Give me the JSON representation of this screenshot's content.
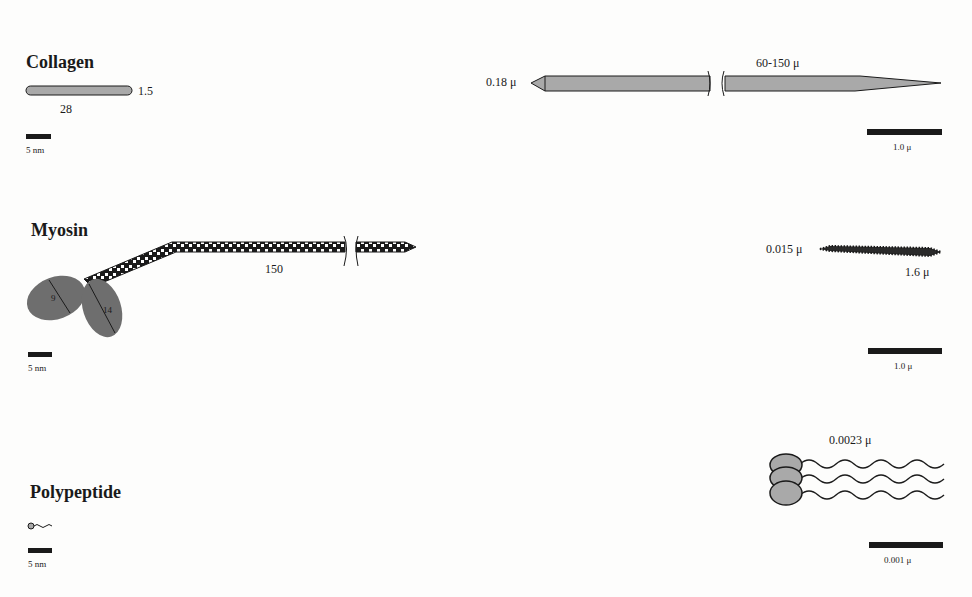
{
  "sections": {
    "collagen": {
      "title": "Collagen",
      "molecule": {
        "length_label": "28",
        "width_label": "1.5",
        "scale_label": "5 nm"
      },
      "fibril": {
        "length_label": "60-150 μ",
        "width_label": "0.18 μ",
        "scale_label": "1.0 μ"
      }
    },
    "myosin": {
      "title": "Myosin",
      "molecule": {
        "tail_label": "150",
        "head1_label": "9",
        "head2_label": "14",
        "scale_label": "5 nm"
      },
      "filament": {
        "width_label": "0.015 μ",
        "length_label": "1.6 μ",
        "scale_label": "1.0 μ"
      }
    },
    "polypeptide": {
      "title": "Polypeptide",
      "molecule": {
        "scale_label": "5 nm"
      },
      "assembly": {
        "length_label": "0.0023 μ",
        "scale_label": "0.001 μ"
      }
    }
  },
  "colors": {
    "fill_gray": "#a9a9a9",
    "head_gray": "#6e6e6e",
    "ink": "#1a1a1a"
  }
}
